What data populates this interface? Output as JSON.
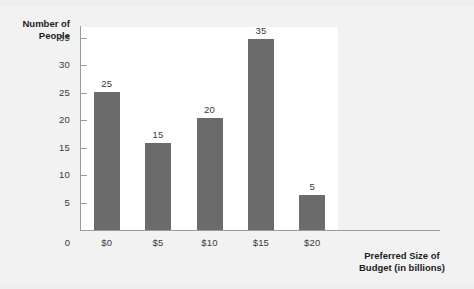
{
  "chart_data": {
    "type": "bar",
    "title": "",
    "xlabel": "Preferred Size of Budget (in billions)",
    "xlabel_lines": [
      "Preferred Size of",
      "Budget (in billions)"
    ],
    "ylabel": "Number of People",
    "ylabel_lines": [
      "Number of",
      "People"
    ],
    "categories": [
      "$0",
      "$5",
      "$10",
      "$15",
      "$20"
    ],
    "values": [
      25,
      15,
      20,
      35,
      5
    ],
    "data_labels": [
      "25",
      "15",
      "20",
      "35",
      "5"
    ],
    "ylim": [
      0,
      37
    ],
    "yticks": [
      0,
      5,
      10,
      15,
      20,
      25,
      30,
      35
    ],
    "ytick_labels": [
      "0",
      "5",
      "10",
      "15",
      "20",
      "25",
      "30",
      "35"
    ],
    "grid": false,
    "legend": false,
    "legend_position": "none",
    "bar_color": "#6b6b6b",
    "plot_background": "#ffffff",
    "page_background": "#f2f2f2",
    "axis_color": "#9a9a9a",
    "text_color": "#3a3a3a",
    "title_color": "#1d1d1d"
  }
}
